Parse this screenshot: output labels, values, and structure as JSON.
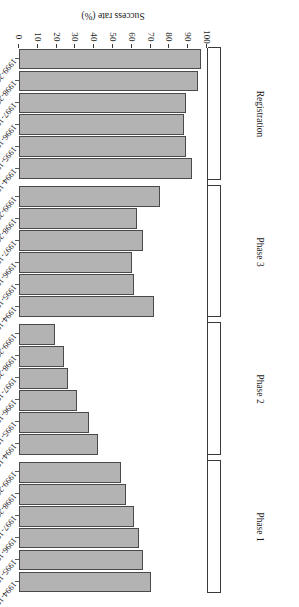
{
  "figure": {
    "axis_title": "Success rate (%)",
    "bar_fill": "#b3b3b3",
    "bar_edge": "#4a4a4a",
    "axis_color": "#3a3a3a"
  },
  "chart_data": {
    "type": "bar",
    "orientation": "horizontal",
    "title": "",
    "xlabel": "Success rate (%)",
    "ylabel": "Year of entry into phase",
    "xlim": [
      0,
      100
    ],
    "grid": false,
    "legend": "none",
    "tick_labels": [
      "0",
      "10",
      "20",
      "30",
      "40",
      "50",
      "60",
      "70",
      "80",
      "90",
      "100"
    ],
    "tick_values": [
      0,
      10,
      20,
      30,
      40,
      50,
      60,
      70,
      80,
      90,
      100
    ],
    "categories": [
      "1994-1996",
      "1995-1997",
      "1996-1998",
      "1997-1999",
      "1998-2000",
      "1999-2001"
    ],
    "groups": [
      {
        "name": "Phase 1",
        "categories": [
          "1994-1996",
          "1995-1997",
          "1996-1998",
          "1997-1999",
          "1998-2000",
          "1999-2001"
        ],
        "values": [
          70,
          66,
          64,
          61,
          57,
          54
        ]
      },
      {
        "name": "Phase 2",
        "categories": [
          "1994-1996",
          "1995-1997",
          "1996-1998",
          "1997-1999",
          "1998-2000",
          "1999-2001"
        ],
        "values": [
          42,
          37,
          31,
          26,
          24,
          19
        ]
      },
      {
        "name": "Phase 3",
        "categories": [
          "1994-1996",
          "1995-1997",
          "1996-1998",
          "1997-1999",
          "1998-2000",
          "1999-2001"
        ],
        "values": [
          72,
          61,
          60,
          66,
          63,
          75
        ]
      },
      {
        "name": "Registration",
        "categories": [
          "1994-1996",
          "1995-1997",
          "1996-1998",
          "1997-1999",
          "1998-2000",
          "1999-2001"
        ],
        "values": [
          92,
          89,
          88,
          89,
          95,
          97
        ]
      }
    ]
  }
}
